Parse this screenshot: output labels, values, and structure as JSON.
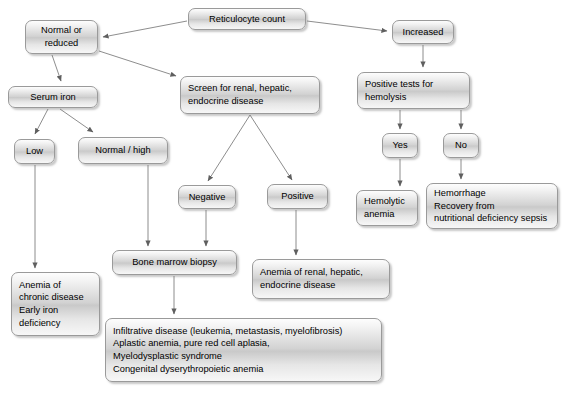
{
  "diagram": {
    "type": "flowchart",
    "canvas": {
      "width": 566,
      "height": 402
    },
    "style": {
      "box_fill_light": "#fdfdfd",
      "box_fill_mid": "#c9c9c9",
      "box_border": "#9a9a9a",
      "text_color": "#000000",
      "edge_color": "#6e6e6e",
      "background": "#ffffff"
    },
    "nodes": [
      {
        "id": "reticulocyte-count",
        "label": "Reticulocyte count",
        "x": 188,
        "y": 8,
        "w": 118,
        "h": 22,
        "align": "center"
      },
      {
        "id": "normal-or-reduced",
        "label": "Normal or\nreduced",
        "x": 25,
        "y": 20,
        "w": 73,
        "h": 34,
        "align": "center"
      },
      {
        "id": "increased",
        "label": "Increased",
        "x": 392,
        "y": 20,
        "w": 62,
        "h": 24,
        "align": "center"
      },
      {
        "id": "screen-renal-hepatic-endocrine",
        "label": "Screen for renal, hepatic,\nendocrine disease",
        "x": 180,
        "y": 76,
        "w": 140,
        "h": 38,
        "align": "left"
      },
      {
        "id": "positive-tests-hemolysis",
        "label": "Positive tests for\nhemolysis",
        "x": 357,
        "y": 72,
        "w": 113,
        "h": 37,
        "align": "left"
      },
      {
        "id": "serum-iron",
        "label": "Serum iron",
        "x": 8,
        "y": 86,
        "w": 90,
        "h": 22,
        "align": "center"
      },
      {
        "id": "low",
        "label": "Low",
        "x": 14,
        "y": 139,
        "w": 41,
        "h": 25,
        "align": "center"
      },
      {
        "id": "normal-high",
        "label": "Normal / high",
        "x": 78,
        "y": 137,
        "w": 90,
        "h": 27,
        "align": "center"
      },
      {
        "id": "yes",
        "label": "Yes",
        "x": 382,
        "y": 133,
        "w": 36,
        "h": 25,
        "align": "center"
      },
      {
        "id": "no",
        "label": "No",
        "x": 443,
        "y": 133,
        "w": 36,
        "h": 25,
        "align": "center"
      },
      {
        "id": "negative",
        "label": "Negative",
        "x": 178,
        "y": 185,
        "w": 58,
        "h": 24,
        "align": "center"
      },
      {
        "id": "positive",
        "label": "Positive",
        "x": 267,
        "y": 184,
        "w": 61,
        "h": 25,
        "align": "center"
      },
      {
        "id": "hemolytic-anemia",
        "label": "Hemolytic\nanemia",
        "x": 356,
        "y": 190,
        "w": 62,
        "h": 36,
        "align": "left"
      },
      {
        "id": "hemorrhage-recovery",
        "label": "Hemorrhage\nRecovery from\nnutritional deficiency sepsis",
        "x": 426,
        "y": 183,
        "w": 132,
        "h": 46,
        "align": "left"
      },
      {
        "id": "bone-marrow-biopsy",
        "label": "Bone marrow biopsy",
        "x": 112,
        "y": 250,
        "w": 125,
        "h": 25,
        "align": "center"
      },
      {
        "id": "anemia-renal-hepatic-endocrine",
        "label": "Anemia of renal, hepatic,\nendocrine disease",
        "x": 252,
        "y": 259,
        "w": 138,
        "h": 40,
        "align": "left"
      },
      {
        "id": "anemia-chronic-disease",
        "label": "Anemia of\nchronic disease\nEarly iron\ndeficiency",
        "x": 11,
        "y": 272,
        "w": 89,
        "h": 64,
        "align": "left"
      },
      {
        "id": "marrow-findings",
        "label": "Infiltrative disease (leukemia, metastasis, myelofibrosis)\nAplastic anemia, pure red cell aplasia,\nMyelodysplastic syndrome\nCongenital dyserythropoietic anemia",
        "x": 105,
        "y": 318,
        "w": 277,
        "h": 64,
        "align": "left"
      }
    ],
    "edges": [
      {
        "id": "edge-retic-to-normal",
        "from": "reticulocyte-count",
        "to": "normal-or-reduced",
        "arrow": true
      },
      {
        "id": "edge-retic-to-increased",
        "from": "reticulocyte-count",
        "to": "increased",
        "arrow": true
      },
      {
        "id": "edge-normal-to-serum-iron",
        "from": "normal-or-reduced",
        "to": "serum-iron",
        "arrow": true
      },
      {
        "id": "edge-normal-to-screen",
        "from": "normal-or-reduced",
        "to": "screen-renal-hepatic-endocrine",
        "arrow": true
      },
      {
        "id": "edge-increased-to-hemolysis",
        "from": "increased",
        "to": "positive-tests-hemolysis",
        "arrow": true
      },
      {
        "id": "edge-serum-iron-to-low",
        "from": "serum-iron",
        "to": "low",
        "arrow": true
      },
      {
        "id": "edge-serum-iron-to-normal-high",
        "from": "serum-iron",
        "to": "normal-high",
        "arrow": true
      },
      {
        "id": "edge-screen-to-negative",
        "from": "screen-renal-hepatic-endocrine",
        "to": "negative",
        "arrow": true
      },
      {
        "id": "edge-screen-to-positive",
        "from": "screen-renal-hepatic-endocrine",
        "to": "positive",
        "arrow": true
      },
      {
        "id": "edge-hemolysis-to-yes",
        "from": "positive-tests-hemolysis",
        "to": "yes",
        "arrow": true
      },
      {
        "id": "edge-hemolysis-to-no",
        "from": "positive-tests-hemolysis",
        "to": "no",
        "arrow": true
      },
      {
        "id": "edge-yes-to-hemolytic",
        "from": "yes",
        "to": "hemolytic-anemia",
        "arrow": true
      },
      {
        "id": "edge-no-to-hemorrhage",
        "from": "no",
        "to": "hemorrhage-recovery",
        "arrow": true
      },
      {
        "id": "edge-low-to-chronic",
        "from": "low",
        "to": "anemia-chronic-disease",
        "arrow": true
      },
      {
        "id": "edge-normal-high-to-marrow",
        "from": "normal-high",
        "to": "bone-marrow-biopsy",
        "arrow": true
      },
      {
        "id": "edge-negative-to-marrow",
        "from": "negative",
        "to": "bone-marrow-biopsy",
        "arrow": true
      },
      {
        "id": "edge-positive-to-anemia-renal",
        "from": "positive",
        "to": "anemia-renal-hepatic-endocrine",
        "arrow": true
      },
      {
        "id": "edge-marrow-to-findings",
        "from": "bone-marrow-biopsy",
        "to": "marrow-findings",
        "arrow": true
      }
    ]
  }
}
